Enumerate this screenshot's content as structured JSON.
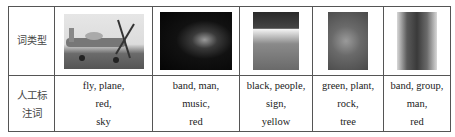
{
  "table": {
    "row_labels": {
      "image_row": "词类型",
      "annotation_row_line1": "人工标",
      "annotation_row_line2": "注词"
    },
    "columns": [
      {
        "image": "airplane-photo",
        "words": [
          "fly, plane,",
          "red,",
          "sky"
        ]
      },
      {
        "image": "band-dark-photo",
        "words": [
          "band, man,",
          "music,",
          "red"
        ]
      },
      {
        "image": "sign-poster-photo",
        "words": [
          "black, people,",
          "sign,",
          "yellow"
        ]
      },
      {
        "image": "plant-photo",
        "words": [
          "green, plant,",
          "rock,",
          "tree"
        ]
      },
      {
        "image": "two-people-photo",
        "words": [
          "band, group,",
          "man,",
          "red"
        ]
      }
    ]
  }
}
